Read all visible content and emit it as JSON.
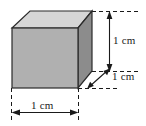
{
  "figure": {
    "kind": "labelled-3d-cube-diagram",
    "shape_name": "cube",
    "background_color": "#ffffff",
    "faces": {
      "top": {
        "name": "top-face",
        "color": "#d6d6d6"
      },
      "front": {
        "name": "front-face",
        "color": "#b0b0b0"
      },
      "right": {
        "name": "right-face",
        "color": "#8c8c8c"
      }
    },
    "edge_color": "#2b2b2b",
    "dimension_line_color": "#1a1a1a",
    "extension_line_style": "dashed",
    "dimensions": [
      {
        "id": "width",
        "label": "1 cm",
        "orientation": "horizontal",
        "measures": "front face width (bottom edge)"
      },
      {
        "id": "height",
        "label": "1 cm",
        "orientation": "vertical",
        "measures": "cube height (right side)"
      },
      {
        "id": "depth",
        "label": "1 cm",
        "orientation": "diagonal",
        "measures": "cube depth (receding edge)"
      }
    ]
  }
}
